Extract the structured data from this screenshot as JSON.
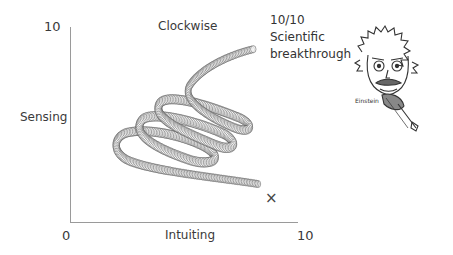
{
  "chart_data": {
    "type": "line",
    "title": "Clockwise",
    "xlabel": "Intuiting",
    "ylabel": "Sensing",
    "xlim": [
      0,
      10
    ],
    "ylim": [
      0,
      10
    ],
    "x_ticks": [
      "0",
      "10"
    ],
    "y_ticks": [
      "10"
    ],
    "grid": false,
    "series": [
      {
        "name": "spiral path",
        "style": "coil of small circles",
        "description": "Starts low-right, travels left, then spirals clockwise upward-right in three loops to top-right",
        "x": [
          8.4,
          6.0,
          3.5,
          2.2,
          2.9,
          6.2,
          4.0,
          3.3,
          7.0,
          4.8,
          4.2,
          7.9,
          5.5,
          5.0,
          6.4,
          8.2
        ],
        "y": [
          2.0,
          2.8,
          3.7,
          4.2,
          4.8,
          3.4,
          4.8,
          5.6,
          4.0,
          5.6,
          6.4,
          5.1,
          6.6,
          7.2,
          8.6,
          8.9
        ]
      }
    ],
    "annotations": [
      {
        "text": "10/10 Scientific breakthrough",
        "at": "top-right end of spiral"
      },
      {
        "text": "×",
        "x": 8.8,
        "y": 1.2,
        "meaning": "marker near end"
      },
      {
        "text": "Einstein",
        "type": "caricature illustration"
      }
    ]
  },
  "labels": {
    "y_max": "10",
    "origin": "0",
    "x_max": "10",
    "title": "Clockwise",
    "y_axis": "Sensing",
    "x_axis": "Intuiting",
    "note_line1": "10/10",
    "note_line2": "Scientific",
    "note_line3": "breakthrough",
    "cross_mark": "×",
    "einstein_caption": "Einstein"
  },
  "colors": {
    "axis": "#9a9a9a",
    "coil_stroke": "#555555",
    "text": "#333333"
  }
}
